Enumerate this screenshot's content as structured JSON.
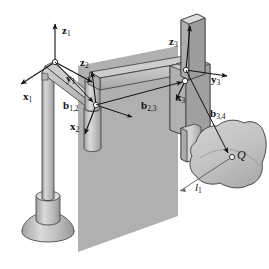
{
  "figure": {
    "background_color": "#ffffff"
  },
  "colors": {
    "link_fill": "#b9b9b9",
    "link_fill_light": "#d2d2d2",
    "link_fill_dark": "#9a9a9a",
    "plane_fill": "#a8a8a8",
    "workpiece_fill": "#c4c4c4",
    "outline": "#2b2b2b",
    "arrow": "#1a1a1a",
    "label_text": "#111111",
    "faint_label": "#b5b5b5"
  },
  "labels": {
    "z1": {
      "vec": "z",
      "sub": "1"
    },
    "y1": {
      "vec": "y",
      "sub": "1"
    },
    "x1": {
      "vec": "x",
      "sub": "1"
    },
    "z2": {
      "vec": "z",
      "sub": "2"
    },
    "y2": {
      "vec": "y",
      "sub": "2"
    },
    "x2": {
      "vec": "x",
      "sub": "2"
    },
    "z3": {
      "vec": "z",
      "sub": "3"
    },
    "y3": {
      "vec": "y",
      "sub": "3"
    },
    "x3": {
      "vec": "x",
      "sub": "3"
    },
    "b12": {
      "vec": "b",
      "sub": "1,2"
    },
    "b23": {
      "vec": "b",
      "sub": "2,3"
    },
    "b34": {
      "vec": "b",
      "sub": "3,4"
    },
    "point_q": {
      "vec": "Q",
      "sub": ""
    },
    "line_l1": {
      "vec": "l",
      "sub": "1"
    }
  },
  "elements": {
    "base": "pedestal-base",
    "column": "vertical-column-link-1",
    "upper_arm": "horizontal-link-1",
    "joint2": "revolute-joint-2",
    "forearm": "horizontal-link-2",
    "joint3": "prismatic-joint-3",
    "slider": "prismatic-slider-z3",
    "workpiece": "workpiece-surface",
    "plane": "reference-plane"
  },
  "frames": [
    {
      "name": "frame-1",
      "origin": [
        55,
        62
      ],
      "axes": [
        "x1",
        "y1",
        "z1"
      ]
    },
    {
      "name": "frame-2",
      "origin": [
        96,
        105
      ],
      "axes": [
        "x2",
        "y2",
        "z2"
      ]
    },
    {
      "name": "frame-3",
      "origin": [
        185,
        81
      ],
      "axes": [
        "x3",
        "y3",
        "z3"
      ]
    }
  ],
  "vectors": [
    {
      "name": "b12",
      "from": [
        55,
        62
      ],
      "to": [
        96,
        105
      ]
    },
    {
      "name": "b23",
      "from": [
        96,
        105
      ],
      "to": [
        185,
        81
      ]
    },
    {
      "name": "b34",
      "from": [
        185,
        81
      ],
      "to": [
        231,
        155
      ]
    },
    {
      "name": "l1",
      "from": [
        231,
        155
      ],
      "to": [
        183,
        190
      ]
    }
  ]
}
